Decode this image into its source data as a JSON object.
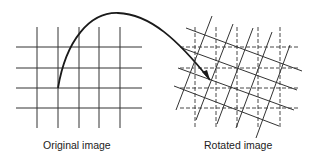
{
  "diagram": {
    "type": "image-rotation-illustration",
    "colors": {
      "line": "#333333",
      "arrow": "#1a1a1a",
      "background": "#ffffff"
    },
    "original": {
      "caption": "Original image",
      "vertical_x": [
        37,
        58,
        79,
        99,
        120
      ],
      "vertical_y_range": [
        27,
        128
      ],
      "horizontal_y": [
        47,
        68,
        88,
        108
      ],
      "horizontal_x_range": [
        16,
        142
      ]
    },
    "rotated": {
      "caption": "Rotated image",
      "reference_grid": {
        "style": "dashed",
        "vertical_x": [
          195,
          216,
          237,
          258,
          280
        ],
        "vertical_y_range": [
          27,
          128
        ],
        "horizontal_y": [
          47,
          68,
          88,
          108
        ],
        "horizontal_x_range": [
          180,
          300
        ]
      },
      "rotated_grid": {
        "style": "solid",
        "shallow_lines": [
          [
            [
              186,
              28
            ],
            [
              302,
              71
            ]
          ],
          [
            [
              182,
              48
            ],
            [
              297,
              90
            ]
          ],
          [
            [
              178,
              68
            ],
            [
              294,
              110
            ]
          ],
          [
            [
              174,
              86
            ],
            [
              279,
              126
            ]
          ]
        ],
        "steep_lines": [
          [
            [
              212,
              16
            ],
            [
              176,
              110
            ]
          ],
          [
            [
              233,
              24
            ],
            [
              196,
              120
            ]
          ],
          [
            [
              253,
              28
            ],
            [
              217,
              124
            ]
          ],
          [
            [
              272,
              32
            ],
            [
              236,
              128
            ]
          ],
          [
            [
              290,
              45
            ],
            [
              256,
              138
            ]
          ]
        ]
      }
    },
    "arrow": {
      "path": "M 58 88 C 66 40, 90 12, 118 13 C 150 14, 178 40, 210 80",
      "head": [
        [
          210,
          80
        ],
        [
          202,
          72
        ],
        [
          207,
          70
        ]
      ]
    }
  }
}
